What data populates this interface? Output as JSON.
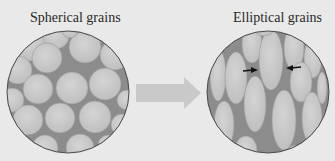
{
  "labels": {
    "left": "Spherical grains",
    "right": "Elliptical grains"
  },
  "colors": {
    "background": "#e9e9e9",
    "matrix": "#8c8c8c",
    "grain": "#c4c4c4",
    "grain_highlight": "#d2d2d2",
    "outline": "#4a4a4a",
    "arrow": "#c9c9c9",
    "pointer": "#111111"
  },
  "diagram": {
    "left_panel": {
      "shape": "circle",
      "content": "spherical-grains"
    },
    "transition": {
      "shape": "arrow",
      "direction": "right"
    },
    "right_panel": {
      "shape": "circle",
      "content": "elliptical-grains",
      "pointers": 2
    }
  }
}
